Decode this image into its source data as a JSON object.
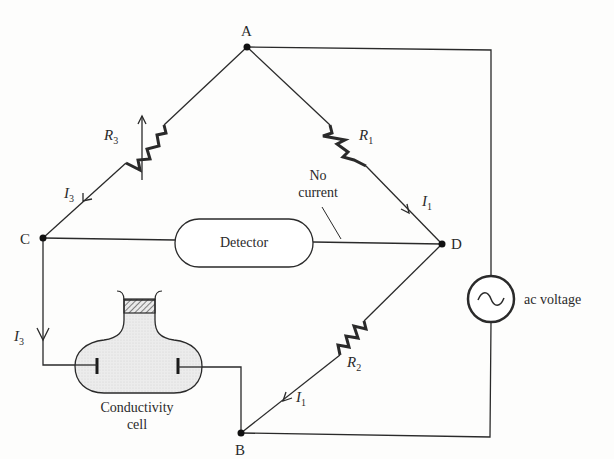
{
  "diagram": {
    "type": "Wheatstone bridge conductivity measurement circuit",
    "nodes": {
      "A": {
        "label": "A"
      },
      "B": {
        "label": "B"
      },
      "C": {
        "label": "C"
      },
      "D": {
        "label": "D"
      }
    },
    "resistors": {
      "r1": {
        "symbol": "R",
        "subscript": "1"
      },
      "r2": {
        "symbol": "R",
        "subscript": "2"
      },
      "r3": {
        "symbol": "R",
        "subscript": "3",
        "variable": true
      }
    },
    "currents": {
      "i1_upper": {
        "symbol": "I",
        "subscript": "1"
      },
      "i1_lower": {
        "symbol": "I",
        "subscript": "1"
      },
      "i3_upper": {
        "symbol": "I",
        "subscript": "3"
      },
      "i3_lower": {
        "symbol": "I",
        "subscript": "3"
      }
    },
    "detector": {
      "label": "Detector"
    },
    "no_current": {
      "line1": "No",
      "line2": "current"
    },
    "source": {
      "label": "ac voltage",
      "icon": "sine-wave-icon"
    },
    "cell": {
      "line1": "Conductivity",
      "line2": "cell"
    }
  }
}
